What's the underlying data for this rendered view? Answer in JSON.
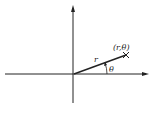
{
  "diagram": {
    "type": "polar-coordinates",
    "labels": {
      "point": "(r,θ)",
      "radius": "r",
      "angle": "θ"
    },
    "colors": {
      "stroke": "#222222",
      "background": "#ffffff"
    }
  }
}
